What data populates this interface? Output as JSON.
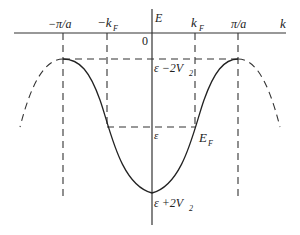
{
  "diagram": {
    "type": "band-structure",
    "axes": {
      "x_label": "k",
      "y_label": "E",
      "origin_label": "0"
    },
    "x_ticks": [
      {
        "label": "−π/a",
        "x": 63
      },
      {
        "label": "−k",
        "sub": "F",
        "x": 107
      },
      {
        "label": "k",
        "sub": "F",
        "x": 195
      },
      {
        "label": "π/a",
        "x": 238
      }
    ],
    "energy_labels": {
      "top": {
        "text": "ε −2V",
        "sub": "2"
      },
      "fermi_mid": {
        "text": "ε"
      },
      "fermi": {
        "text": "E",
        "sub": "F"
      },
      "bottom": {
        "text": "ε +2V",
        "sub": "2"
      }
    },
    "colors": {
      "line": "#222222",
      "background": "#ffffff"
    }
  }
}
